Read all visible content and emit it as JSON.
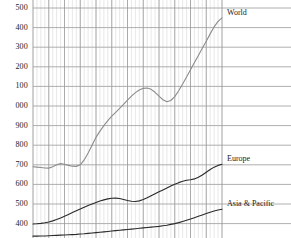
{
  "chart_data": {
    "type": "line",
    "title": "",
    "subtitle": "",
    "xlabel": "",
    "ylabel": "",
    "grid": true,
    "legend_position": "inline-right",
    "ylim": [
      300,
      1500
    ],
    "ytick_labels_as_shown": [
      "500",
      "400",
      "300",
      "200",
      "100",
      "000",
      "900",
      "800",
      "700",
      "600",
      "500",
      "400",
      "300"
    ],
    "ytick_values": [
      1500,
      1400,
      1300,
      1200,
      1100,
      1000,
      900,
      800,
      700,
      600,
      500,
      400,
      300
    ],
    "ytick_note": "Leading thousands digit is cropped at the left edge of the image",
    "xlim": [
      0,
      48
    ],
    "x_major_gridline_count": 12,
    "x_minor_gridline_count": 48,
    "series": [
      {
        "name": "World",
        "color": "#8c8c8c",
        "label_x": 48,
        "values": [
          690,
          688,
          686,
          684,
          683,
          690,
          700,
          706,
          703,
          697,
          693,
          692,
          700,
          725,
          760,
          800,
          840,
          872,
          900,
          925,
          948,
          968,
          988,
          1008,
          1030,
          1050,
          1068,
          1082,
          1090,
          1092,
          1085,
          1070,
          1050,
          1032,
          1022,
          1028,
          1048,
          1078,
          1112,
          1148,
          1185,
          1222,
          1258,
          1295,
          1330,
          1368,
          1404,
          1432,
          1450
        ]
      },
      {
        "name": "Europe",
        "color": "#2a2a2a",
        "label_x": 48,
        "values": [
          398,
          399,
          401,
          404,
          408,
          414,
          421,
          429,
          438,
          447,
          456,
          465,
          474,
          483,
          492,
          500,
          508,
          515,
          521,
          526,
          529,
          530,
          528,
          523,
          518,
          514,
          513,
          516,
          523,
          532,
          542,
          552,
          562,
          572,
          582,
          592,
          601,
          609,
          616,
          621,
          624,
          628,
          636,
          648,
          662,
          676,
          688,
          697,
          703
        ]
      },
      {
        "name": "Asia & Pacific",
        "color": "#2a2a2a",
        "label_x": 48,
        "values": [
          336,
          336,
          337,
          337,
          338,
          339,
          340,
          341,
          342,
          343,
          344,
          345,
          347,
          348,
          350,
          352,
          354,
          356,
          358,
          360,
          362,
          364,
          366,
          368,
          370,
          372,
          374,
          376,
          378,
          380,
          382,
          384,
          386,
          389,
          392,
          396,
          400,
          405,
          411,
          417,
          423,
          430,
          437,
          444,
          451,
          458,
          464,
          469,
          473
        ]
      }
    ]
  },
  "axis": {
    "ytick_labels": [
      {
        "text": "500",
        "value": 1500
      },
      {
        "text": "400",
        "value": 1400
      },
      {
        "text": "300",
        "value": 1300
      },
      {
        "text": "200",
        "value": 1200
      },
      {
        "text": "100",
        "value": 1100
      },
      {
        "text": "000",
        "value": 1000
      },
      {
        "text": "900",
        "value": 900
      },
      {
        "text": "800",
        "value": 800
      },
      {
        "text": "700",
        "value": 700
      },
      {
        "text": "600",
        "value": 600
      },
      {
        "text": "500",
        "value": 500
      },
      {
        "text": "400",
        "value": 400
      },
      {
        "text": "300",
        "value": 300
      }
    ]
  },
  "series_labels": [
    {
      "name": "World",
      "text": "World"
    },
    {
      "name": "Europe",
      "text": "Europe"
    },
    {
      "name": "Asia & Pacific",
      "text": "Asia & Pacific"
    }
  ],
  "colors": {
    "world_line": "#8c8c8c",
    "europe_line": "#2a2a2a",
    "asia_pacific_line": "#2a2a2a",
    "grid_major": "#9a9a9a",
    "grid_minor": "#d8d8d8",
    "text": "#1a1a1a",
    "background": "#ffffff"
  }
}
